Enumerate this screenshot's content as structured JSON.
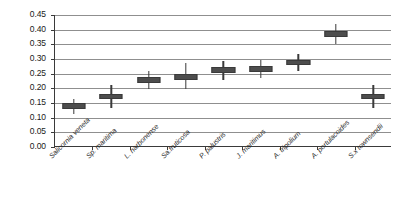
{
  "chart_data": {
    "type": "scatter",
    "title": "",
    "subtitle": "",
    "xlabel": "",
    "ylabel": "",
    "ylim": [
      0.0,
      0.45
    ],
    "ytick_labels": [
      "0.00",
      "0.05",
      "0.10",
      "0.15",
      "0.20",
      "0.25",
      "0.30",
      "0.35",
      "0.40",
      "0.45"
    ],
    "ytick_values": [
      0.0,
      0.05,
      0.1,
      0.15,
      0.2,
      0.25,
      0.3,
      0.35,
      0.4,
      0.45
    ],
    "grid": true,
    "grid_axis": "y",
    "legend": "none",
    "marker_style": "box-with-vertical-error-bar",
    "marker_color": "#4d4d4d",
    "grid_color": "#8f8f8f",
    "axis_color": "#3a3a3a",
    "categories": [
      "Salicornia veneta",
      "Sp. maritima",
      "L. narbonense",
      "Sa.fruticosa",
      "P. palustris",
      "J. maritimus",
      "A. tripolium",
      "A. portulacoides",
      "S.x townsendii"
    ],
    "values": [
      0.14,
      0.172,
      0.228,
      0.24,
      0.262,
      0.265,
      0.288,
      0.385,
      0.172
    ],
    "box_low": [
      0.13,
      0.162,
      0.218,
      0.23,
      0.252,
      0.255,
      0.278,
      0.375,
      0.162
    ],
    "box_high": [
      0.15,
      0.182,
      0.238,
      0.25,
      0.272,
      0.275,
      0.298,
      0.395,
      0.182
    ],
    "error_low": [
      0.112,
      0.133,
      0.198,
      0.196,
      0.228,
      0.234,
      0.258,
      0.352,
      0.132
    ],
    "error_high": [
      0.165,
      0.213,
      0.258,
      0.286,
      0.292,
      0.296,
      0.318,
      0.418,
      0.212
    ]
  }
}
